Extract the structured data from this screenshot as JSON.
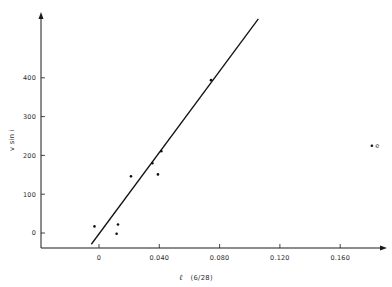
{
  "chart_data": {
    "type": "scatter",
    "title": "",
    "xlabel": "ℓ (6/28)",
    "xlabel_symbol": "ℓ",
    "xlabel_rest": "(6/28)",
    "ylabel": "v sin i",
    "x_ticks": [
      0,
      0.04,
      0.08,
      0.12,
      0.16
    ],
    "x_tick_labels": [
      "0",
      "0.040",
      "0.080",
      "0.120",
      "0.160"
    ],
    "y_ticks": [
      0,
      100,
      200,
      300,
      400
    ],
    "y_tick_labels": [
      "0",
      "100",
      "200",
      "300",
      "400"
    ],
    "xlim": [
      -0.039,
      0.19
    ],
    "ylim": [
      -38,
      570
    ],
    "grid": false,
    "legend": null,
    "series": [
      {
        "name": "observations",
        "marker": "dot",
        "points": [
          {
            "x": -0.003,
            "y": 17
          },
          {
            "x": 0.0117,
            "y": -2
          },
          {
            "x": 0.0126,
            "y": 22
          },
          {
            "x": 0.0212,
            "y": 146
          },
          {
            "x": 0.0354,
            "y": 180
          },
          {
            "x": 0.0391,
            "y": 151
          },
          {
            "x": 0.0413,
            "y": 211
          },
          {
            "x": 0.0743,
            "y": 394
          }
        ]
      },
      {
        "name": "outlier",
        "marker": "dot",
        "points": [
          {
            "x": 0.181,
            "y": 225,
            "label": "e"
          }
        ]
      },
      {
        "name": "linear fit",
        "type": "line",
        "points": [
          {
            "x": -0.0051,
            "y": -29
          },
          {
            "x": 0.1057,
            "y": 552
          }
        ]
      }
    ]
  }
}
